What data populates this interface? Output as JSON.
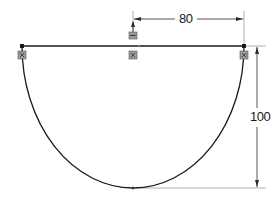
{
  "sketch": {
    "type": "semi-ellipse profile",
    "colors": {
      "geometry": "#1a1a1a",
      "dimension": "#2a2a2a",
      "extension": "#9a9a9a",
      "constraint_fill": "#8c8c8c"
    },
    "geometry": {
      "top_line": {
        "x1": 22,
        "y1": 46,
        "x2": 244,
        "y2": 46
      },
      "arc": {
        "start": [
          22,
          46
        ],
        "end": [
          244,
          46
        ],
        "bottom": [
          133,
          188
        ]
      },
      "center_point": [
        133,
        46
      ]
    },
    "dimensions": [
      {
        "id": "dim80",
        "label": "80",
        "orientation": "horizontal",
        "from": [
          133,
          19
        ],
        "to": [
          244,
          19
        ]
      },
      {
        "id": "dim100",
        "label": "100",
        "orientation": "vertical",
        "from": [
          257,
          46
        ],
        "to": [
          257,
          188
        ]
      }
    ],
    "constraints": [
      {
        "icon": "coincident-constraint-icon",
        "at": [
          22,
          55
        ]
      },
      {
        "icon": "coincident-constraint-icon",
        "at": [
          133,
          55
        ]
      },
      {
        "icon": "coincident-constraint-icon",
        "at": [
          244,
          55
        ]
      },
      {
        "icon": "horizontal-constraint-icon",
        "at": [
          133,
          36
        ]
      }
    ]
  }
}
